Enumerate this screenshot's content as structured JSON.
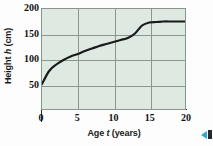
{
  "chart_data": {
    "type": "line",
    "title": "",
    "xlabel": "Age t (years)",
    "xlabel_parts": {
      "pre": "Age ",
      "italic": "t",
      "post": " (years)"
    },
    "ylabel": "Height h (cm)",
    "ylabel_parts": {
      "pre": "Height ",
      "italic": "h",
      "post": " (cm)"
    },
    "xlim": [
      0,
      20
    ],
    "ylim": [
      0,
      200
    ],
    "xticks": [
      0,
      5,
      10,
      15,
      20
    ],
    "xtick_labels": [
      "0",
      "5",
      "10",
      "15",
      "20"
    ],
    "yticks": [
      50,
      100,
      150,
      200
    ],
    "ytick_labels": [
      "50",
      "100",
      "150",
      "200"
    ],
    "grid": true,
    "legend": "none",
    "plot_bgcolor": "#dde9e1",
    "grid_color": "#8c968f",
    "line_color": "#1a1a1a",
    "series": [
      {
        "name": "Height vs Age",
        "x": [
          0,
          1,
          2,
          3,
          4,
          5,
          6,
          7,
          8,
          9,
          10,
          11,
          12,
          13,
          14,
          15,
          16,
          17,
          18,
          19,
          20
        ],
        "y": [
          50,
          76,
          89,
          98,
          105,
          110,
          116,
          121,
          126,
          130,
          134,
          138,
          142,
          151,
          167,
          173,
          174,
          175,
          175,
          175,
          175
        ]
      }
    ]
  },
  "corner": {
    "triangle_color": "#2fa8d8",
    "bar_color": "#2a2a2a"
  }
}
